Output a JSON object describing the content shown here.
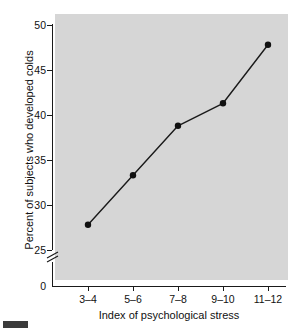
{
  "chart_data": {
    "type": "line",
    "title": "",
    "subtitle": "",
    "xlabel": "Index of psychological stress",
    "ylabel": "Percent of subjects who developed colds",
    "categories": [
      "3–4",
      "5–6",
      "7–8",
      "9–10",
      "11–12"
    ],
    "values": [
      27.8,
      33.3,
      38.8,
      41.3,
      47.8
    ],
    "series": [
      {
        "name": "Percent who developed colds",
        "values": [
          27.8,
          33.3,
          38.8,
          41.3,
          47.8
        ]
      }
    ],
    "ylim": [
      25,
      50
    ],
    "yticks": [
      25,
      30,
      35,
      40,
      45,
      50
    ],
    "ytick_labels": [
      "25",
      "30",
      "35",
      "40",
      "45",
      "50"
    ],
    "y_origin_label": "0",
    "axis_break": true,
    "axis_break_between": [
      0,
      25
    ],
    "grid": false,
    "legend": "none",
    "marker": "filled-circle",
    "plot_background_color": "#d6d6d6",
    "line_color": "#1a1a1a",
    "marker_color": "#111111",
    "axis_color": "#1a1a1a",
    "text_color": "#111111"
  },
  "axis": {
    "y_title": "Percent of subjects who developed colds",
    "x_title": "Index of psychological stress",
    "y_labels": [
      "50",
      "45",
      "40",
      "35",
      "30",
      "25",
      "0"
    ],
    "x_labels": [
      "3–4",
      "5–6",
      "7–8",
      "9–10",
      "11–12"
    ]
  },
  "figure": {
    "caption": ""
  }
}
